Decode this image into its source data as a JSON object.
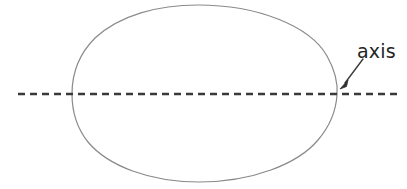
{
  "figure": {
    "width": 407,
    "height": 189,
    "background_color": "#ffffff"
  },
  "shape": {
    "name": "oval",
    "kind": "egg-outline",
    "stroke_color": "#8a8a8a",
    "stroke_width": 1.2,
    "fill": "none",
    "bounds": {
      "left": 72,
      "top": 5,
      "right": 337,
      "bottom": 182
    },
    "center": {
      "x": 198,
      "y": 94
    }
  },
  "axis": {
    "name": "axis-of-symmetry",
    "orientation": "horizontal",
    "style": "dashed",
    "stroke_color": "#3a3a3a",
    "stroke_width": 2.6,
    "dash": 7,
    "gap": 5,
    "y": 94,
    "x_start": 18,
    "x_end": 397
  },
  "annotation": {
    "label": "axis",
    "label_color": "#242424",
    "leader": {
      "name": "leader-arrow",
      "stroke_color": "#3a3a3a",
      "stroke_width": 1.4,
      "from": {
        "x": 363,
        "y": 59
      },
      "to": {
        "x": 341,
        "y": 88
      }
    }
  }
}
